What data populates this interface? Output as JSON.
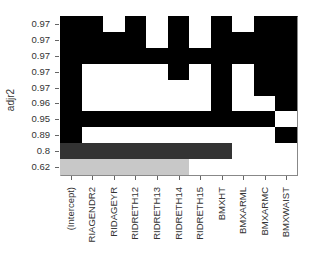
{
  "chart_data": {
    "type": "heatmap",
    "title": "",
    "xlabel": "",
    "ylabel": "adjr2",
    "columns": [
      "(Intercept)",
      "RIAGENDR2",
      "RIDAGEYR",
      "RIDRETH12",
      "RIDRETH13",
      "RIDRETH14",
      "RIDRETH15",
      "BMXHT",
      "BMXARML",
      "BMXARMC",
      "BMXWAIST"
    ],
    "rows": [
      "0.97",
      "0.97",
      "0.97",
      "0.97",
      "0.97",
      "0.96",
      "0.95",
      "0.89",
      "0.8",
      "0.62"
    ],
    "shade_levels": {
      "0": "#ffffff",
      "1": "#000000",
      "2": "#333333",
      "3": "#c8c8c8"
    },
    "matrix": [
      [
        1,
        1,
        0,
        1,
        0,
        1,
        0,
        1,
        0,
        1,
        1
      ],
      [
        1,
        1,
        1,
        1,
        0,
        1,
        0,
        1,
        1,
        1,
        1
      ],
      [
        1,
        1,
        1,
        1,
        1,
        1,
        1,
        1,
        1,
        1,
        1
      ],
      [
        1,
        0,
        0,
        0,
        0,
        1,
        0,
        1,
        0,
        1,
        1
      ],
      [
        1,
        0,
        0,
        0,
        0,
        0,
        0,
        1,
        0,
        1,
        1
      ],
      [
        1,
        0,
        0,
        0,
        0,
        0,
        0,
        1,
        0,
        0,
        1
      ],
      [
        1,
        1,
        1,
        1,
        1,
        1,
        1,
        1,
        1,
        1,
        0
      ],
      [
        1,
        0,
        0,
        0,
        0,
        0,
        0,
        0,
        0,
        0,
        1
      ],
      [
        2,
        2,
        2,
        2,
        2,
        2,
        2,
        2,
        0,
        0,
        0
      ],
      [
        3,
        3,
        3,
        3,
        3,
        3,
        0,
        0,
        0,
        0,
        0
      ]
    ],
    "grid": false,
    "legend": "none"
  }
}
